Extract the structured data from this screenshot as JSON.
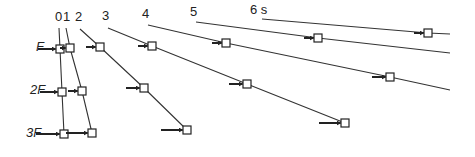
{
  "diagram": {
    "time_unit": "s",
    "time_labels": [
      {
        "text": "0",
        "x": 55,
        "y": 21
      },
      {
        "text": "1",
        "x": 63,
        "y": 21
      },
      {
        "text": "2",
        "x": 75,
        "y": 21
      },
      {
        "text": "3",
        "x": 102,
        "y": 20
      },
      {
        "text": "4",
        "x": 142,
        "y": 18
      },
      {
        "text": "5",
        "x": 190,
        "y": 16
      },
      {
        "text": "6 s",
        "x": 250,
        "y": 14
      }
    ],
    "force_labels": [
      {
        "text": "F",
        "x": 36,
        "y": 51
      },
      {
        "text": "2F",
        "x": 30,
        "y": 94
      },
      {
        "text": "3F",
        "x": 26,
        "y": 137
      }
    ],
    "colors": {
      "line": "#333333",
      "box": "#222222",
      "background": "#ffffff"
    },
    "time_lines": [
      {
        "time": "0",
        "points": [
          [
            59,
            28
          ],
          [
            60,
            49
          ],
          [
            62,
            92
          ],
          [
            64,
            134
          ]
        ]
      },
      {
        "time": "1",
        "points": [
          [
            66,
            28
          ],
          [
            70,
            48
          ],
          [
            82,
            91
          ],
          [
            92,
            133
          ]
        ]
      },
      {
        "time": "2",
        "points": [
          [
            80,
            29
          ],
          [
            100,
            47
          ],
          [
            144,
            88
          ],
          [
            187,
            130
          ]
        ]
      },
      {
        "time": "3",
        "points": [
          [
            108,
            28
          ],
          [
            152,
            46
          ],
          [
            247,
            84
          ],
          [
            345,
            123
          ]
        ]
      },
      {
        "time": "4",
        "points": [
          [
            148,
            25
          ],
          [
            226,
            43
          ],
          [
            390,
            77
          ],
          [
            450,
            90
          ]
        ]
      },
      {
        "time": "5",
        "points": [
          [
            196,
            22
          ],
          [
            318,
            38
          ],
          [
            450,
            53
          ]
        ]
      },
      {
        "time": "6",
        "points": [
          [
            262,
            19
          ],
          [
            428,
            33
          ],
          [
            450,
            34
          ]
        ]
      }
    ],
    "blocks": [
      {
        "force": "F",
        "time": "0",
        "x": 60,
        "y": 49,
        "arrow_len": 18
      },
      {
        "force": "F",
        "time": "1",
        "x": 70,
        "y": 48,
        "arrow_len": 6
      },
      {
        "force": "F",
        "time": "2",
        "x": 100,
        "y": 47,
        "arrow_len": 10
      },
      {
        "force": "F",
        "time": "3",
        "x": 152,
        "y": 46,
        "arrow_len": 10
      },
      {
        "force": "F",
        "time": "4",
        "x": 226,
        "y": 43,
        "arrow_len": 10
      },
      {
        "force": "F",
        "time": "5",
        "x": 318,
        "y": 38,
        "arrow_len": 10
      },
      {
        "force": "F",
        "time": "6",
        "x": 428,
        "y": 33,
        "arrow_len": 10
      },
      {
        "force": "2F",
        "time": "0",
        "x": 62,
        "y": 92,
        "arrow_len": 18
      },
      {
        "force": "2F",
        "time": "1",
        "x": 82,
        "y": 91,
        "arrow_len": 10
      },
      {
        "force": "2F",
        "time": "2",
        "x": 144,
        "y": 88,
        "arrow_len": 14
      },
      {
        "force": "2F",
        "time": "3",
        "x": 247,
        "y": 84,
        "arrow_len": 14
      },
      {
        "force": "2F",
        "time": "4",
        "x": 390,
        "y": 77,
        "arrow_len": 14
      },
      {
        "force": "3F",
        "time": "0",
        "x": 64,
        "y": 134,
        "arrow_len": 24
      },
      {
        "force": "3F",
        "time": "1",
        "x": 92,
        "y": 133,
        "arrow_len": 22
      },
      {
        "force": "3F",
        "time": "2",
        "x": 187,
        "y": 130,
        "arrow_len": 22
      },
      {
        "force": "3F",
        "time": "3",
        "x": 345,
        "y": 123,
        "arrow_len": 22
      }
    ]
  }
}
